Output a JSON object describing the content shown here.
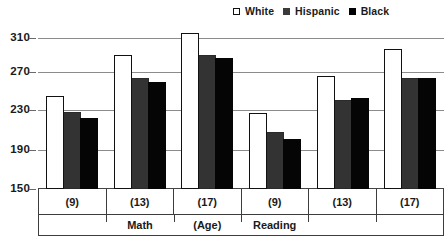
{
  "legend": {
    "position": "top-right",
    "items": [
      {
        "label": "White",
        "icon": "square-outline-icon",
        "color": "#ffffff"
      },
      {
        "label": "Hispanic",
        "icon": "square-filled-icon",
        "color": "#333333"
      },
      {
        "label": "Black",
        "icon": "square-filled-icon",
        "color": "#050505"
      }
    ]
  },
  "axis": {
    "y_ticks": [
      "310",
      "270",
      "230",
      "190",
      "150"
    ],
    "x_age_labels": [
      "(9)",
      "(13)",
      "(17)",
      "(9)",
      "(13)",
      "(17)"
    ],
    "x_subject_labels": [
      "",
      "Math",
      "(Age)",
      "Reading",
      "",
      ""
    ]
  },
  "footnote": "",
  "chart_data": {
    "type": "bar",
    "title": "",
    "subtitle": "",
    "xlabel": "(Age)",
    "ylabel": "",
    "ylim": [
      150,
      320
    ],
    "yticks": [
      150,
      190,
      230,
      270,
      310
    ],
    "grid": true,
    "legend_position": "top-right",
    "categories": [
      "(9)",
      "(13)",
      "(17)",
      "(9)",
      "(13)",
      "(17)"
    ],
    "category_groups": [
      "Math",
      "Math",
      "Math",
      "Reading",
      "Reading",
      "Reading"
    ],
    "series": [
      {
        "name": "White",
        "color": "#ffffff",
        "values": [
          247,
          290,
          313,
          229,
          268,
          296
        ]
      },
      {
        "name": "Hispanic",
        "color": "#333333",
        "values": [
          230,
          266,
          290,
          209,
          243,
          266
        ]
      },
      {
        "name": "Black",
        "color": "#050505",
        "values": [
          224,
          262,
          287,
          202,
          245,
          266
        ]
      }
    ],
    "annotations": [
      "Math",
      "(Age)",
      "Reading"
    ]
  }
}
